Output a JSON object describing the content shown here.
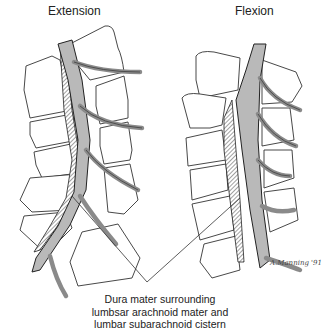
{
  "figure": {
    "panels": [
      {
        "id": "extension",
        "label": "Extension"
      },
      {
        "id": "flexion",
        "label": "Flexion"
      }
    ],
    "caption": {
      "lines": [
        "Dura mater surrounding",
        "lumbsar arachnoid mater and",
        "lumbar subarachnoid cistern"
      ]
    },
    "signature": "A.Manning '91",
    "colors": {
      "dura_fill": "#b9b9b9",
      "outline": "#333333",
      "background": "#ffffff"
    }
  }
}
